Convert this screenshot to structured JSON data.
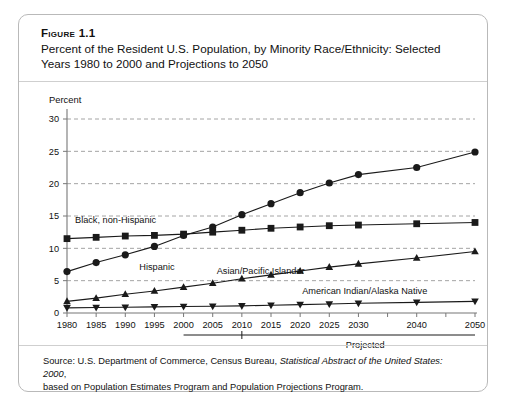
{
  "figure": {
    "label": "Figure 1.1",
    "title_line1": "Percent of the Resident U.S. Population, by Minority Race/Ethnicity: Selected Years",
    "title_line2": "1980 to 2000 and Projections to 2050"
  },
  "source": {
    "line1_pre": "Source: U.S. Department of Commerce, Census Bureau, ",
    "line1_italic": "Statistical Abstract of the United States: 2000",
    "line1_post": ",",
    "line2": "based on Population Estimates Program and Population Projections Program."
  },
  "annotations": {
    "projected": "Projected"
  },
  "colors": {
    "line": "#1a1a1a",
    "grid": "#9a9a9a",
    "axis": "#777777",
    "border": "#b9b9b9",
    "background": "#ffffff"
  },
  "chart_data": {
    "type": "line",
    "title": "Percent of the Resident U.S. Population, by Minority Race/Ethnicity: Selected Years 1980 to 2000 and Projections to 2050",
    "xlabel": "",
    "ylabel": "Percent",
    "ylim": [
      0,
      30
    ],
    "yticks": [
      0,
      5,
      10,
      15,
      20,
      25,
      30
    ],
    "grid": true,
    "legend": "inline-labels",
    "x": [
      1980,
      1985,
      1990,
      1995,
      2000,
      2005,
      2010,
      2015,
      2020,
      2025,
      2030,
      2040,
      2050
    ],
    "xtick_labels": [
      "1980",
      "1985",
      "1990",
      "1995",
      "2000",
      "2005",
      "2010",
      "2015",
      "2020",
      "2025",
      "2030",
      "2040",
      "2050"
    ],
    "projected_from": 2000,
    "series": [
      {
        "name": "Black, non-Hispanic",
        "marker": "square",
        "values": [
          11.5,
          11.7,
          11.9,
          12.0,
          12.2,
          12.5,
          12.8,
          13.1,
          13.3,
          13.5,
          13.6,
          13.8,
          14.0
        ]
      },
      {
        "name": "Hispanic",
        "marker": "circle",
        "values": [
          6.4,
          7.8,
          9.0,
          10.3,
          12.0,
          13.3,
          15.2,
          16.9,
          18.6,
          20.1,
          21.4,
          22.5,
          24.9
        ]
      },
      {
        "name": "Asian/Pacific Islander",
        "marker": "triangle-up",
        "values": [
          1.8,
          2.3,
          2.9,
          3.4,
          4.0,
          4.6,
          5.3,
          5.9,
          6.5,
          7.1,
          7.6,
          8.5,
          9.5
        ]
      },
      {
        "name": "American Indian/Alaska Native",
        "marker": "triangle-down",
        "values": [
          0.8,
          0.85,
          0.9,
          0.95,
          1.0,
          1.05,
          1.1,
          1.2,
          1.3,
          1.4,
          1.5,
          1.65,
          1.8
        ]
      }
    ]
  }
}
